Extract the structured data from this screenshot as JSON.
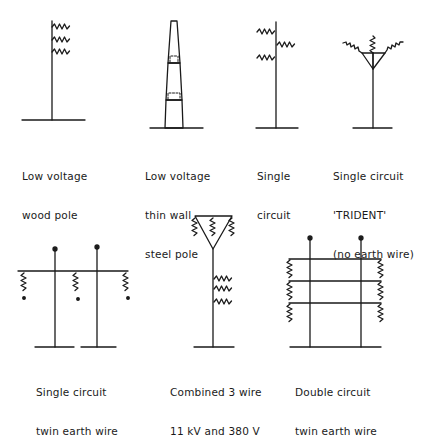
{
  "figure": {
    "type": "line-support-types",
    "colors": {
      "ink": "#1a1a1a",
      "background": "#ffffff"
    },
    "items": [
      {
        "id": "lv-wood",
        "lines": [
          "Low voltage",
          "wood pole"
        ]
      },
      {
        "id": "lv-steel",
        "lines": [
          "Low voltage",
          "thin wall",
          "steel pole"
        ]
      },
      {
        "id": "single",
        "lines": [
          "Single",
          "circuit"
        ]
      },
      {
        "id": "trident",
        "lines": [
          "Single circuit",
          "'TRIDENT'",
          "(no earth wire)"
        ]
      },
      {
        "id": "twin-earth",
        "lines": [
          "Single circuit",
          "twin earth wire"
        ]
      },
      {
        "id": "combined",
        "lines": [
          "Combined 3 wire",
          "11 kV and 380 V"
        ]
      },
      {
        "id": "double",
        "lines": [
          "Double circuit",
          "twin earth wire"
        ]
      }
    ]
  }
}
